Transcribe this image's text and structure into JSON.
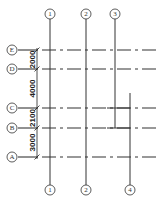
{
  "vertical_axes": [
    {
      "label": "1",
      "top_bubble": true,
      "bottom_bubble": true
    },
    {
      "label": "2",
      "top_bubble": true,
      "bottom_bubble": true
    },
    {
      "label": "3",
      "top_bubble": true,
      "bottom_bubble": false
    },
    {
      "label": "4",
      "top_bubble": false,
      "bottom_bubble": true
    }
  ],
  "horizontal_axes": [
    "E",
    "D",
    "C",
    "B",
    "A"
  ],
  "dimensions": [
    {
      "between": [
        "E",
        "D"
      ],
      "value": "2000"
    },
    {
      "between": [
        "D",
        "C"
      ],
      "value": "4000"
    },
    {
      "between": [
        "C",
        "B"
      ],
      "value": "2100"
    },
    {
      "between": [
        "B",
        "A"
      ],
      "value": "3000"
    }
  ],
  "colors": {
    "line": "#333333",
    "background": "#ffffff"
  }
}
